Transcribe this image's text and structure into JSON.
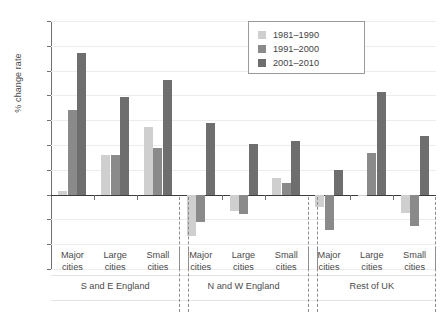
{
  "chart_data": {
    "type": "bar",
    "title": "",
    "xlabel": "",
    "ylabel": "% change rate",
    "ylim": [
      -6.0,
      14.0
    ],
    "ytick_labels": [
      "14.0",
      "12.0",
      "10.0",
      "8.0",
      "6.0",
      "4.0",
      "2.0",
      "0.0",
      "-2.0",
      "-4.0",
      "-6.0"
    ],
    "ytick_values": [
      14.0,
      12.0,
      10.0,
      8.0,
      6.0,
      4.0,
      2.0,
      0.0,
      -2.0,
      -4.0,
      -6.0
    ],
    "grid": true,
    "legend_position": "top-right",
    "legend": [
      "1981–1990",
      "1991–2000",
      "2001–2010"
    ],
    "series": [
      {
        "name": "1981–1990",
        "color": "#cfcfcf",
        "values": [
          0.3,
          3.2,
          5.45,
          -3.35,
          -1.35,
          1.35,
          -1.0,
          -0.1,
          -1.5
        ]
      },
      {
        "name": "1991–2000",
        "color": "#8a8a8a",
        "values": [
          6.8,
          3.2,
          3.75,
          -2.2,
          -1.55,
          0.9,
          -2.85,
          3.35,
          -2.5
        ]
      },
      {
        "name": "2001–2010",
        "color": "#6e6e6e",
        "values": [
          11.4,
          7.9,
          9.25,
          5.75,
          4.05,
          4.35,
          2.0,
          8.25,
          4.7
        ]
      }
    ],
    "categories": [
      "Major cities",
      "Large cities",
      "Small cities",
      "Major cities",
      "Large cities",
      "Small cities",
      "Major cities",
      "Large cities",
      "Small cities"
    ],
    "category_lines": [
      [
        "Major",
        "cities"
      ],
      [
        "Large",
        "cities"
      ],
      [
        "Small",
        "cities"
      ],
      [
        "Major",
        "cities"
      ],
      [
        "Large",
        "cities"
      ],
      [
        "Small",
        "cities"
      ],
      [
        "Major",
        "cities"
      ],
      [
        "Large",
        "cities"
      ],
      [
        "Small",
        "cities"
      ]
    ],
    "groups": [
      "S and E England",
      "N and W England",
      "Rest of UK"
    ]
  }
}
